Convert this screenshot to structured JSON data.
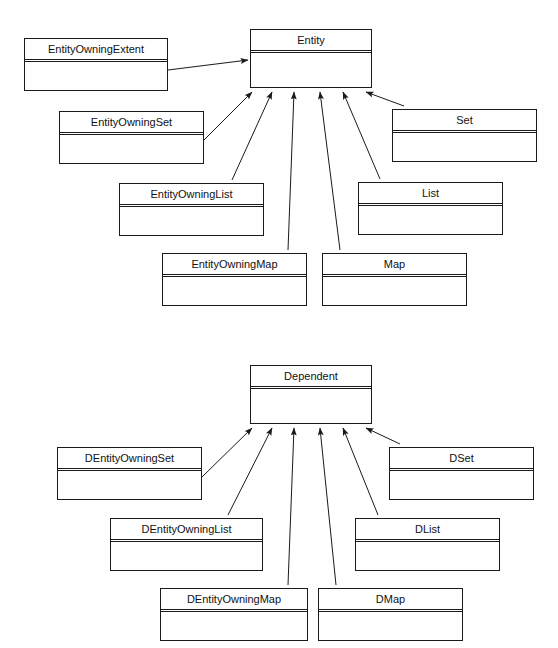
{
  "diagram": {
    "type": "uml-class-diagram",
    "background_color": "#ffffff",
    "line_color": "#1a1a1a",
    "text_color": "#111111",
    "relationship_type": "generalization"
  },
  "groups": [
    {
      "id": "entity-hierarchy",
      "base_class": "Entity"
    },
    {
      "id": "dependent-hierarchy",
      "base_class": "Dependent"
    }
  ],
  "classes": [
    {
      "id": "entity",
      "name": "Entity",
      "group": "entity-hierarchy",
      "role": "superclass",
      "x": 250,
      "y": 29,
      "w": 122,
      "h": 59
    },
    {
      "id": "entity-owning-extent",
      "name": "EntityOwningExtent",
      "group": "entity-hierarchy",
      "role": "subclass",
      "x": 24,
      "y": 38,
      "w": 144,
      "h": 53
    },
    {
      "id": "entity-owning-set",
      "name": "EntityOwningSet",
      "group": "entity-hierarchy",
      "role": "subclass",
      "x": 59,
      "y": 111,
      "w": 145,
      "h": 53
    },
    {
      "id": "entity-owning-list",
      "name": "EntityOwningList",
      "group": "entity-hierarchy",
      "role": "subclass",
      "x": 119,
      "y": 183,
      "w": 145,
      "h": 53
    },
    {
      "id": "entity-owning-map",
      "name": "EntityOwningMap",
      "group": "entity-hierarchy",
      "role": "subclass",
      "x": 162,
      "y": 253,
      "w": 145,
      "h": 53
    },
    {
      "id": "set",
      "name": "Set",
      "group": "entity-hierarchy",
      "role": "subclass",
      "x": 392,
      "y": 109,
      "w": 145,
      "h": 53
    },
    {
      "id": "list",
      "name": "List",
      "group": "entity-hierarchy",
      "role": "subclass",
      "x": 358,
      "y": 182,
      "w": 145,
      "h": 53
    },
    {
      "id": "map",
      "name": "Map",
      "group": "entity-hierarchy",
      "role": "subclass",
      "x": 322,
      "y": 253,
      "w": 145,
      "h": 53
    },
    {
      "id": "dependent",
      "name": "Dependent",
      "group": "dependent-hierarchy",
      "role": "superclass",
      "x": 250,
      "y": 365,
      "w": 122,
      "h": 59
    },
    {
      "id": "d-entity-owning-set",
      "name": "DEntityOwningSet",
      "group": "dependent-hierarchy",
      "role": "subclass",
      "x": 57,
      "y": 447,
      "w": 145,
      "h": 53
    },
    {
      "id": "d-entity-owning-list",
      "name": "DEntityOwningList",
      "group": "dependent-hierarchy",
      "role": "subclass",
      "x": 110,
      "y": 518,
      "w": 153,
      "h": 53
    },
    {
      "id": "d-entity-owning-map",
      "name": "DEntityOwningMap",
      "group": "dependent-hierarchy",
      "role": "subclass",
      "x": 160,
      "y": 588,
      "w": 148,
      "h": 53
    },
    {
      "id": "d-set",
      "name": "DSet",
      "group": "dependent-hierarchy",
      "role": "subclass",
      "x": 389,
      "y": 447,
      "w": 145,
      "h": 53
    },
    {
      "id": "d-list",
      "name": "DList",
      "group": "dependent-hierarchy",
      "role": "subclass",
      "x": 355,
      "y": 518,
      "w": 145,
      "h": 53
    },
    {
      "id": "d-map",
      "name": "DMap",
      "group": "dependent-hierarchy",
      "role": "subclass",
      "x": 318,
      "y": 588,
      "w": 145,
      "h": 53
    }
  ],
  "generalizations": [
    {
      "id": "gen-extent-entity",
      "from": "entity-owning-extent",
      "to": "entity",
      "x1": 168,
      "y1": 70,
      "x2": 248,
      "y2": 60
    },
    {
      "id": "gen-set-entity",
      "from": "entity-owning-set",
      "to": "entity",
      "x1": 204,
      "y1": 140,
      "x2": 252,
      "y2": 92
    },
    {
      "id": "gen-list-entity",
      "from": "entity-owning-list",
      "to": "entity",
      "x1": 232,
      "y1": 180,
      "x2": 272,
      "y2": 92
    },
    {
      "id": "gen-map-entity",
      "from": "entity-owning-map",
      "to": "entity",
      "x1": 288,
      "y1": 250,
      "x2": 294,
      "y2": 92
    },
    {
      "id": "gen-map2-entity",
      "from": "map",
      "to": "entity",
      "x1": 340,
      "y1": 250,
      "x2": 320,
      "y2": 92
    },
    {
      "id": "gen-list2-entity",
      "from": "list",
      "to": "entity",
      "x1": 380,
      "y1": 179,
      "x2": 343,
      "y2": 92
    },
    {
      "id": "gen-set2-entity",
      "from": "set",
      "to": "entity",
      "x1": 404,
      "y1": 106,
      "x2": 366,
      "y2": 92
    },
    {
      "id": "gen-dset-dep",
      "from": "d-entity-owning-set",
      "to": "dependent",
      "x1": 202,
      "y1": 477,
      "x2": 252,
      "y2": 428
    },
    {
      "id": "gen-dlist-dep",
      "from": "d-entity-owning-list",
      "to": "dependent",
      "x1": 228,
      "y1": 515,
      "x2": 272,
      "y2": 428
    },
    {
      "id": "gen-dmap-dep",
      "from": "d-entity-owning-map",
      "to": "dependent",
      "x1": 288,
      "y1": 585,
      "x2": 294,
      "y2": 428
    },
    {
      "id": "gen-dmap2-dep",
      "from": "d-map",
      "to": "dependent",
      "x1": 336,
      "y1": 585,
      "x2": 320,
      "y2": 428
    },
    {
      "id": "gen-dlist2-dep",
      "from": "d-list",
      "to": "dependent",
      "x1": 378,
      "y1": 515,
      "x2": 343,
      "y2": 428
    },
    {
      "id": "gen-dset2-dep",
      "from": "d-set",
      "to": "dependent",
      "x1": 400,
      "y1": 444,
      "x2": 366,
      "y2": 428
    }
  ]
}
